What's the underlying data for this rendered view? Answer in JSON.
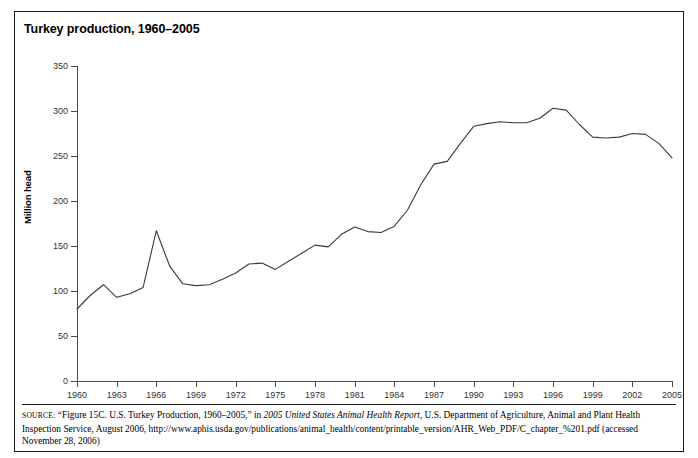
{
  "figure_caption": "FIGURE 4.10",
  "chart_title": "Turkey production, 1960–2005",
  "source_note": {
    "label": "SOURCE:",
    "text_before_italic": " “Figure 15C. U.S. Turkey Production, 1960–2005,” in ",
    "italic_title": "2005 United States Animal Health Report",
    "text_after_italic": ", U.S. Department of Agriculture, Animal and Plant Health Inspection Service, August 2006, http://www.aphis.usda.gov/publications/animal_health/content/printable_version/AHR_Web_PDF/C_chapter_%201.pdf (accessed November 28, 2006)"
  },
  "colors": {
    "line": "#3a3a3a",
    "axis": "#4a4a4a",
    "frame": "#1a1a1a",
    "text": "#000000"
  },
  "chart_data": {
    "type": "line",
    "title": "Turkey production, 1960–2005",
    "xlabel": "",
    "ylabel": "Million head",
    "xlim": [
      1960,
      2005
    ],
    "ylim": [
      0,
      350
    ],
    "yticks": [
      0,
      50,
      100,
      150,
      200,
      250,
      300,
      350
    ],
    "xticks": [
      1960,
      1963,
      1966,
      1969,
      1972,
      1975,
      1978,
      1981,
      1984,
      1987,
      1990,
      1993,
      1996,
      1999,
      2002,
      2005
    ],
    "grid": false,
    "legend": null,
    "series": [
      {
        "name": "Turkey production",
        "units": "Million head",
        "x": [
          1960,
          1961,
          1962,
          1963,
          1964,
          1965,
          1966,
          1967,
          1968,
          1969,
          1970,
          1971,
          1972,
          1973,
          1974,
          1975,
          1976,
          1977,
          1978,
          1979,
          1980,
          1981,
          1982,
          1983,
          1984,
          1985,
          1986,
          1987,
          1988,
          1989,
          1990,
          1991,
          1992,
          1993,
          1994,
          1995,
          1996,
          1997,
          1998,
          1999,
          2000,
          2001,
          2002,
          2003,
          2004,
          2005
        ],
        "values": [
          80,
          95,
          107,
          93,
          97,
          104,
          167,
          128,
          108,
          106,
          107,
          113,
          120,
          130,
          131,
          124,
          133,
          142,
          151,
          149,
          163,
          171,
          166,
          165,
          172,
          190,
          218,
          241,
          244,
          264,
          283,
          286,
          288,
          287,
          287,
          292,
          303,
          301,
          285,
          271,
          270,
          271,
          275,
          274,
          264,
          248
        ]
      }
    ]
  }
}
